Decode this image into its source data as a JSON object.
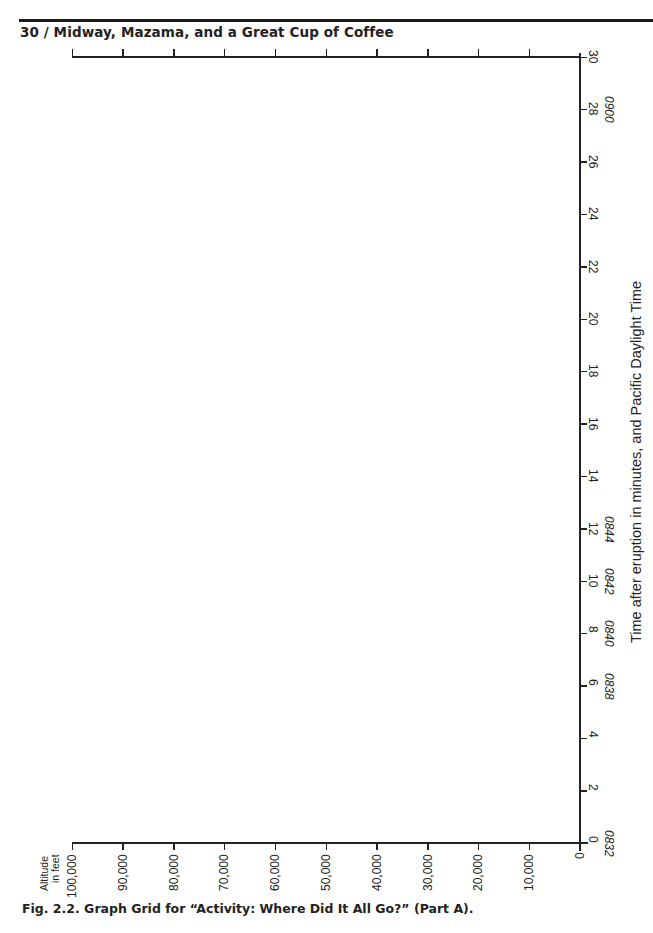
{
  "page": {
    "running_head": "30 / Midway, Mazama, and a Great Cup of Coffee",
    "caption": "Fig. 2.2. Graph Grid for “Activity: Where Did It All Go?” (Part A)."
  },
  "chart_data": {
    "type": "line",
    "title": "Graph Grid for “Activity: Where Did It All Go?” (Part A)",
    "note": "Empty graph grid (no plotted data); page is rotated so altitude runs along bottom edge and time runs up right edge.",
    "xlabel": "Altitude in feet",
    "ylabel": "Time after eruption in minutes, and Pacific Daylight Time",
    "x_ticks": [
      "0",
      "10,000",
      "20,000",
      "30,000",
      "40,000",
      "50,000",
      "60,000",
      "70,000",
      "80,000",
      "90,000",
      "100,000"
    ],
    "x_tick_values": [
      0,
      10000,
      20000,
      30000,
      40000,
      50000,
      60000,
      70000,
      80000,
      90000,
      100000
    ],
    "xlim": [
      0,
      100000
    ],
    "y_ticks": [
      "0",
      "2",
      "4",
      "6",
      "8",
      "10",
      "12",
      "14",
      "16",
      "18",
      "20",
      "22",
      "24",
      "26",
      "28",
      "30"
    ],
    "y_tick_values": [
      0,
      2,
      4,
      6,
      8,
      10,
      12,
      14,
      16,
      18,
      20,
      22,
      24,
      26,
      28,
      30
    ],
    "ylim": [
      0,
      30
    ],
    "y_secondary_ticks": [
      {
        "minute": 0,
        "label": "0832"
      },
      {
        "minute": 6,
        "label": "0838"
      },
      {
        "minute": 8,
        "label": "0840"
      },
      {
        "minute": 10,
        "label": "0842"
      },
      {
        "minute": 12,
        "label": "0844"
      },
      {
        "minute": 28,
        "label": "0900"
      }
    ],
    "series": [],
    "grid": false,
    "legend": null
  },
  "axis": {
    "x_title_line1": "Altitude",
    "x_title_line2": "in feet",
    "y_title": "Time after eruption in minutes, and Pacific Daylight Time"
  }
}
